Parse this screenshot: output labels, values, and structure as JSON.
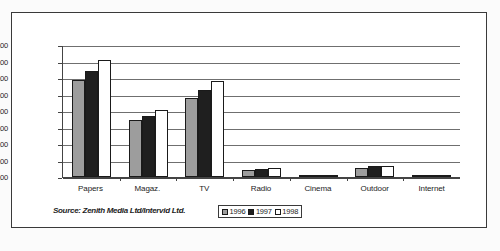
{
  "chart_data": {
    "type": "bar",
    "title": "",
    "subtitle": "",
    "xlabel": "",
    "ylabel": "",
    "categories": [
      "Papers",
      "Magaz.",
      "TV",
      "Radio",
      "Cinema",
      "Outdoor",
      "Internet"
    ],
    "series": [
      {
        "name": "1996",
        "color": "#9d9d9d",
        "values": [
          5.9,
          3.45,
          4.8,
          0.45,
          0.05,
          0.52,
          0.01
        ]
      },
      {
        "name": "1997",
        "color": "#1f1f1f",
        "values": [
          6.42,
          3.7,
          5.25,
          0.5,
          0.06,
          0.64,
          0.03
        ]
      },
      {
        "name": "1998",
        "color": "#ffffff",
        "values": [
          7.1,
          4.08,
          5.8,
          0.55,
          0.1,
          0.66,
          0.05
        ]
      }
    ],
    "ylim": [
      0,
      8
    ],
    "ytick_step": 1,
    "ytick_labels": [
      "8,00",
      "7,00",
      "6,00",
      "5,00",
      "4,00",
      "3,00",
      "2,00",
      "1,00",
      "0,00"
    ],
    "grid": true,
    "grid_axis": "y",
    "legend_position": "bottom-center",
    "annotations": [
      "Source: Zenith Media Ltd/Intervid Ltd."
    ]
  },
  "source_note": "Source: Zenith Media Ltd/Intervid Ltd.",
  "legend": {
    "entries": [
      {
        "label": "1996",
        "color": "#9d9d9d"
      },
      {
        "label": "1997",
        "color": "#1f1f1f"
      },
      {
        "label": "1998",
        "color": "#ffffff"
      }
    ]
  }
}
